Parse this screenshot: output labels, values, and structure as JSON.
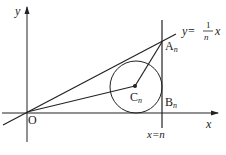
{
  "diagram": {
    "type": "geometry",
    "labels": {
      "y_axis": "y",
      "x_axis": "x",
      "origin": "O",
      "point_a": "A",
      "point_a_sub": "n",
      "point_b": "B",
      "point_b_sub": "n",
      "point_c": "C",
      "point_c_sub": "n",
      "line_eq_lhs": "y=",
      "line_eq_num": "1",
      "line_eq_den": "n",
      "line_eq_var": "x",
      "vertical_eq": "x=n"
    },
    "elements": [
      "x-axis with arrow",
      "y-axis with arrow",
      "line y=(1/n)x through origin",
      "vertical line x=n",
      "circle centered at C_n tangent to line, x-axis and x=n",
      "segment O to C_n",
      "segment C_n to A_n"
    ],
    "colors": {
      "stroke": "#222222",
      "background": "#ffffff"
    }
  }
}
